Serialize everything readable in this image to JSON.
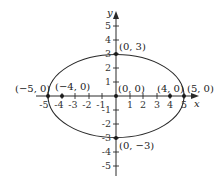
{
  "diagram": {
    "type": "ellipse-on-coordinate-axes",
    "equation_shape": "ellipse centered at origin, semi-major 5 (x), semi-minor 3 (y)",
    "axes": {
      "x_label": "x",
      "y_label": "y",
      "x_ticks": [
        "-5",
        "-4",
        "-3",
        "-2",
        "-1",
        "1",
        "2",
        "3",
        "4",
        "5"
      ],
      "y_ticks": [
        "5",
        "4",
        "3",
        "2",
        "1",
        "-1",
        "-2",
        "-3",
        "-4",
        "-5"
      ],
      "x_range": [
        -5,
        5
      ],
      "y_range": [
        -5,
        5
      ]
    },
    "points": [
      {
        "label": "(0, 3)",
        "x": 0,
        "y": 3
      },
      {
        "label": "(−5, 0)",
        "x": -5,
        "y": 0
      },
      {
        "label": "(−4, 0)",
        "x": -4,
        "y": 0
      },
      {
        "label": "(0, 0)",
        "x": 0,
        "y": 0
      },
      {
        "label": "(4, 0)",
        "x": 4,
        "y": 0
      },
      {
        "label": "(5, 0)",
        "x": 5,
        "y": 0
      },
      {
        "label": "(0, −3)",
        "x": 0,
        "y": -3
      }
    ],
    "colors": {
      "stroke": "#2a2a2a",
      "background": "#ffffff"
    }
  }
}
